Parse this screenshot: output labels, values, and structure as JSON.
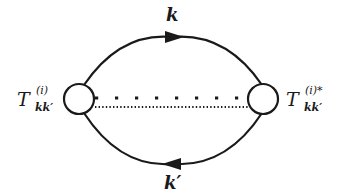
{
  "diagram": {
    "type": "feynman-loop",
    "colors": {
      "line": "#1a1a1a",
      "background": "#ffffff"
    },
    "top_propagator": {
      "label": "k",
      "arrow_direction": "right"
    },
    "bottom_propagator": {
      "label": "k′",
      "arrow_direction": "left"
    },
    "left_vertex": {
      "symbol": "T",
      "superscript": "(i)",
      "subscript": "kk′"
    },
    "right_vertex": {
      "symbol": "T",
      "superscript": "(i)*",
      "subscript": "kk′"
    },
    "connectors": [
      {
        "style": "square-dotted",
        "position": "upper"
      },
      {
        "style": "fine-dotted",
        "position": "lower"
      }
    ]
  }
}
